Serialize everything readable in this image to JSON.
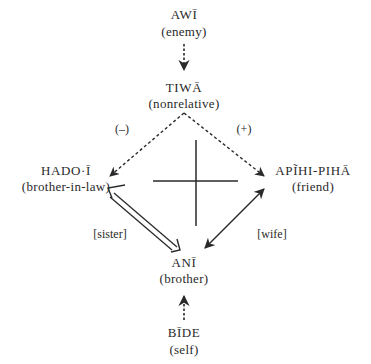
{
  "nodes": {
    "enemy": {
      "term": "AWĪ",
      "gloss": "(enemy)"
    },
    "nonrel": {
      "term": "TIWĀ",
      "gloss": "(nonrelative)"
    },
    "inlaw": {
      "term": "HADO·Ī",
      "gloss": "(brother-in-law)"
    },
    "friend": {
      "term": "APĨHI-PIHĀ",
      "gloss": "(friend)"
    },
    "brother": {
      "term": "ANĪ",
      "gloss": "(brother)"
    },
    "self": {
      "term": "BĪDE",
      "gloss": "(self)"
    }
  },
  "edges": {
    "minus": "(–)",
    "plus": "(+)",
    "sister": "[sister]",
    "wife": "[wife]"
  },
  "colors": {
    "ink": "#2a2a2a",
    "background": "#ffffff"
  }
}
